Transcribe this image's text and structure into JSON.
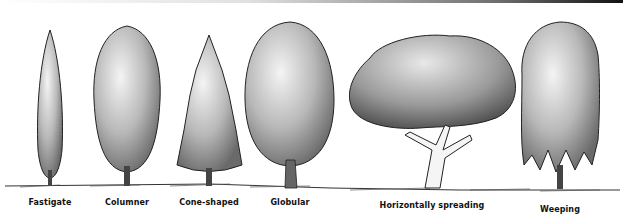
{
  "figure": {
    "title": "",
    "trees": [
      {
        "id": "fastigate",
        "label": "Fastigate",
        "x": 50,
        "label_y": 203
      },
      {
        "id": "columner",
        "label": "Columner",
        "x": 127,
        "label_y": 203
      },
      {
        "id": "cone-shaped",
        "label": "Cone-shaped",
        "x": 209,
        "label_y": 203
      },
      {
        "id": "globular",
        "label": "Globular",
        "x": 290,
        "label_y": 203
      },
      {
        "id": "horizontally-spreading",
        "label": "Horizontally spreading",
        "x": 432,
        "label_y": 206
      },
      {
        "id": "weeping",
        "label": "Weeping",
        "x": 560,
        "label_y": 209
      }
    ]
  }
}
